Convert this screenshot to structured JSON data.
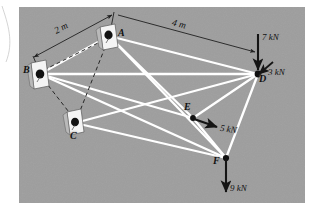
{
  "figure": {
    "background_color": "#9c9c9c",
    "page_color": "#ffffff",
    "member_color": "#ffffff",
    "dashed_color": "#2a2a2a",
    "arrow_color": "#1a1a1a",
    "support_plate_color": "#f2f2f2"
  },
  "nodes": [
    {
      "id": "A",
      "label": "A",
      "x": 109,
      "y": 36,
      "type": "support",
      "label_dx": 9,
      "label_dy": -9
    },
    {
      "id": "B",
      "label": "B",
      "x": 40,
      "y": 74,
      "type": "support",
      "label_dx": -13,
      "label_dy": -6
    },
    {
      "id": "C",
      "label": "C",
      "x": 75,
      "y": 123,
      "type": "support",
      "label_dx": -3,
      "label_dy": 6
    },
    {
      "id": "D",
      "label": "D",
      "x": 258,
      "y": 74,
      "type": "joint",
      "label_dx": 2,
      "label_dy": 1
    },
    {
      "id": "E",
      "label": "E",
      "x": 193,
      "y": 118,
      "type": "joint",
      "label_dx": -3,
      "label_dy": -14
    },
    {
      "id": "F",
      "label": "F",
      "x": 226,
      "y": 158,
      "type": "joint",
      "label_dx": -11,
      "label_dy": -4
    }
  ],
  "members": [
    {
      "from": "B",
      "to": "A",
      "style": "dashed"
    },
    {
      "from": "B",
      "to": "C",
      "style": "dashed"
    },
    {
      "from": "C",
      "to": "A",
      "style": "dashed"
    },
    {
      "from": "B",
      "to": "D",
      "style": "solid"
    },
    {
      "from": "B",
      "to": "E",
      "style": "solid"
    },
    {
      "from": "B",
      "to": "F",
      "style": "solid"
    },
    {
      "from": "A",
      "to": "D",
      "style": "solid"
    },
    {
      "from": "A",
      "to": "E",
      "style": "solid"
    },
    {
      "from": "A",
      "to": "F",
      "style": "solid"
    },
    {
      "from": "C",
      "to": "D",
      "style": "solid"
    },
    {
      "from": "C",
      "to": "F",
      "style": "solid"
    },
    {
      "from": "E",
      "to": "D",
      "style": "solid"
    },
    {
      "from": "E",
      "to": "F",
      "style": "solid"
    },
    {
      "from": "D",
      "to": "F",
      "style": "solid"
    }
  ],
  "forces": [
    {
      "id": "force-7kN",
      "label": "7 kN",
      "at": "D",
      "magnitude": 7,
      "unit": "kN",
      "direction": "down",
      "tail_x": 258,
      "tail_y": 36,
      "head_x": 258,
      "head_y": 72,
      "label_x": 262,
      "label_y": 38
    },
    {
      "id": "force-3kN",
      "label": "3 kN",
      "at": "D",
      "magnitude": 3,
      "unit": "kN",
      "direction": "down-left",
      "tail_x": 272,
      "tail_y": 63,
      "head_x": 257,
      "head_y": 75,
      "label_x": 266,
      "label_y": 70
    },
    {
      "id": "force-5kN",
      "label": "5 kN",
      "at": "E",
      "magnitude": 5,
      "unit": "kN",
      "direction": "right-down",
      "tail_x": 194,
      "tail_y": 119,
      "head_x": 220,
      "head_y": 128,
      "label_x": 221,
      "label_y": 124
    },
    {
      "id": "force-9kN",
      "label": "9 kN",
      "at": "F",
      "magnitude": 9,
      "unit": "kN",
      "direction": "down",
      "tail_x": 226,
      "tail_y": 159,
      "head_x": 226,
      "head_y": 196,
      "label_x": 230,
      "label_y": 186
    }
  ],
  "dimensions": [
    {
      "id": "dim-2m",
      "label": "2 m",
      "value": 2,
      "unit": "m",
      "from_x": 113,
      "from_y": 15,
      "to_x": 33,
      "to_y": 58,
      "label_x": 58,
      "label_y": 26,
      "rotation": -28
    },
    {
      "id": "dim-4m",
      "label": "4 m",
      "value": 4,
      "unit": "m",
      "from_x": 116,
      "from_y": 14,
      "to_x": 256,
      "to_y": 52,
      "label_x": 177,
      "label_y": 22,
      "rotation": 13
    }
  ]
}
